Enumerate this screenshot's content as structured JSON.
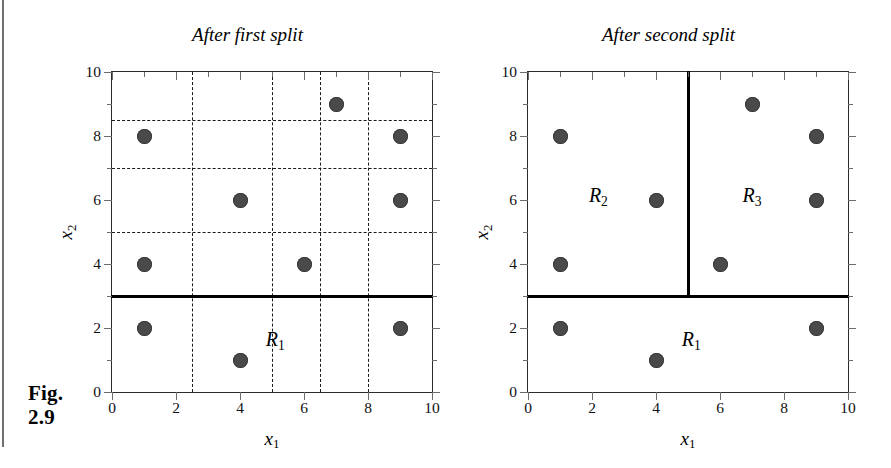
{
  "figure": {
    "caption_line1": "Fig.",
    "caption_line2": "2.9"
  },
  "axes": {
    "xlabel_base": "x",
    "xlabel_sub": "1",
    "ylabel_base": "x",
    "ylabel_sub": "2",
    "x_tick_labels": [
      "0",
      "2",
      "4",
      "6",
      "8",
      "10"
    ],
    "y_tick_labels": [
      "0",
      "2",
      "4",
      "6",
      "8",
      "10"
    ],
    "x_tick_values": [
      0,
      2,
      4,
      6,
      8,
      10
    ],
    "y_tick_values": [
      0,
      2,
      4,
      6,
      8,
      10
    ],
    "minor_tick_values": [
      1,
      3,
      5,
      7,
      9
    ],
    "xlim": [
      0,
      10
    ],
    "ylim": [
      0,
      10
    ]
  },
  "colors": {
    "point_fill": "#4a4a4a",
    "frame": "#2b2b2b",
    "split_line": "#000000",
    "grid_dash": "#1a1a1a"
  },
  "panels": [
    {
      "id": "after-first-split",
      "title": "After first split",
      "grid_visible": true,
      "grid_h": [
        5,
        7,
        8.5
      ],
      "grid_v": [
        2.5,
        5,
        6.5,
        8
      ],
      "splits_h": [
        3
      ],
      "splits_v": [],
      "regions": [
        {
          "base": "R",
          "sub": "1",
          "x": 5.1,
          "y": 1.6
        }
      ]
    },
    {
      "id": "after-second-split",
      "title": "After second split",
      "grid_visible": false,
      "grid_h": [],
      "grid_v": [],
      "splits_h": [
        3
      ],
      "splits_v": [
        5
      ],
      "regions": [
        {
          "base": "R",
          "sub": "2",
          "x": 2.2,
          "y": 6.1
        },
        {
          "base": "R",
          "sub": "3",
          "x": 7.0,
          "y": 6.1
        },
        {
          "base": "R",
          "sub": "1",
          "x": 5.1,
          "y": 1.6
        }
      ]
    }
  ],
  "chart_data": {
    "type": "scatter",
    "xlabel": "x1",
    "ylabel": "x2",
    "xlim": [
      0,
      10
    ],
    "ylim": [
      0,
      10
    ],
    "grid": "dashed candidate split lines in left panel only",
    "legend": "none",
    "points": [
      {
        "x": 1,
        "y": 8
      },
      {
        "x": 1,
        "y": 4
      },
      {
        "x": 1,
        "y": 2
      },
      {
        "x": 4,
        "y": 6
      },
      {
        "x": 4,
        "y": 1
      },
      {
        "x": 6,
        "y": 4
      },
      {
        "x": 7,
        "y": 9
      },
      {
        "x": 9,
        "y": 8
      },
      {
        "x": 9,
        "y": 6
      },
      {
        "x": 9,
        "y": 2
      }
    ],
    "x": [
      1,
      1,
      1,
      4,
      4,
      6,
      7,
      9,
      9,
      9
    ],
    "y": [
      8,
      4,
      2,
      6,
      1,
      4,
      9,
      8,
      6,
      2
    ],
    "panels": [
      {
        "title": "After first split",
        "splits": [
          {
            "orientation": "horizontal",
            "value": 3
          }
        ],
        "candidate_grid_horizontal": [
          5,
          7,
          8.5
        ],
        "candidate_grid_vertical": [
          2.5,
          5,
          6.5,
          8
        ],
        "region_labels": [
          {
            "label": "R1",
            "x": 5.1,
            "y": 1.6
          }
        ]
      },
      {
        "title": "After second split",
        "splits": [
          {
            "orientation": "horizontal",
            "value": 3
          },
          {
            "orientation": "vertical",
            "value": 5,
            "above": 3
          }
        ],
        "candidate_grid_horizontal": [],
        "candidate_grid_vertical": [],
        "region_labels": [
          {
            "label": "R2",
            "x": 2.2,
            "y": 6.1
          },
          {
            "label": "R3",
            "x": 7.0,
            "y": 6.1
          },
          {
            "label": "R1",
            "x": 5.1,
            "y": 1.6
          }
        ]
      }
    ]
  }
}
